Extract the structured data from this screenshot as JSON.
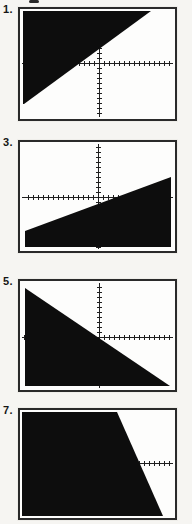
{
  "figure": {
    "kind": "scanned textbook figure of four graphing-calculator screens",
    "cropped_text_artifact": "partial glyph cut off at top edge of scan"
  },
  "colors": {
    "page_bg": "#f6f5f2",
    "screen_bg": "#fdfdfc",
    "shade": "#0d0d0d",
    "axis": "#1f1f1f",
    "frame": "#2a2a2a",
    "ink": "#151515"
  },
  "chart_data": [
    {
      "label": "1.",
      "type": "area",
      "title": "",
      "xlabel": "",
      "ylabel": "",
      "description": "Calculator screen: half-plane above a rising line is shaded black; line passes just above origin; unlabeled axes with unit tick marks",
      "shaded": "above",
      "estimated_inequality": "y ≥ 0.7x + 3 (ticks = 1 unit, approx.)",
      "line_endpoints_units": [
        [
          -15.0,
          -8.2
        ],
        [
          10.4,
          10.4
        ]
      ],
      "plot_w": 151,
      "plot_h": 106,
      "origin_px": [
        77,
        52
      ],
      "tick_px": 5,
      "polygon": "1,0 129,0 2,93 1,93"
    },
    {
      "label": "3.",
      "type": "area",
      "title": "",
      "xlabel": "",
      "ylabel": "",
      "description": "Calculator screen: half-plane below a gently rising line is shaded black; x-axis sits high with origin right of center-top; unlabeled axes with unit tick marks",
      "shaded": "below",
      "estimated_inequality": "y ≤ 0.37x − 1.4 (ticks = 1 unit, approx.)",
      "line_endpoints_units": [
        [
          -14.6,
          -6.8
        ],
        [
          14.6,
          4.0
        ]
      ],
      "plot_w": 151,
      "plot_h": 105,
      "origin_px": [
        76,
        53
      ],
      "tick_px": 5,
      "polygon": "3,87 149,33 149,103 3,103"
    },
    {
      "label": "5.",
      "type": "area",
      "title": "",
      "xlabel": "",
      "ylabel": "",
      "description": "Calculator screen: half-plane below a falling line through the origin is shaded black; unlabeled axes with unit tick marks",
      "shaded": "below",
      "estimated_inequality": "y ≤ −0.7x (ticks = 1 unit, approx.)",
      "line_endpoints_units": [
        [
          -14.8,
          9.8
        ],
        [
          14.2,
          -9.8
        ]
      ],
      "plot_w": 151,
      "plot_h": 105,
      "origin_px": [
        77,
        54
      ],
      "tick_px": 5,
      "polygon": "3,5 148,103 3,103"
    },
    {
      "label": "7.",
      "type": "area",
      "title": "",
      "xlabel": "",
      "ylabel": "",
      "description": "Calculator screen (cut off at bottom of scan): region left of a steep falling line is shaded black; only a short ticked segment of the x-axis shows at right",
      "shaded": "left / below",
      "estimated_inequality": "y ≤ −2.3x + 18 (ticks = 1 unit, approx.)",
      "line_endpoints_units": [
        [
          3.6,
          10.2
        ],
        [
          12.8,
          -10.6
        ]
      ],
      "plot_w": 151,
      "plot_h": 104,
      "origin_px": [
        77,
        51
      ],
      "tick_px": 5,
      "polygon": "0,0 95,0 141,104 0,104"
    }
  ]
}
